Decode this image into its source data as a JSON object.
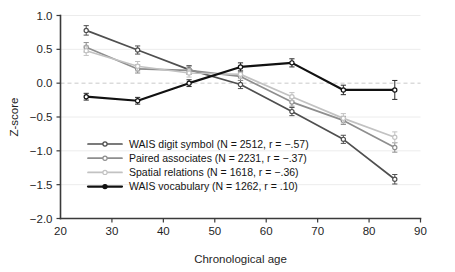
{
  "figure": {
    "partial_top_text": "",
    "background": "#ffffff"
  },
  "axes": {
    "y_title": "Z-score",
    "x_title": "Chronological age",
    "y_ticks": [
      "1.0",
      "0.5",
      "0.0",
      "-0.5",
      "-1.0",
      "-1.5",
      "-2.0"
    ],
    "x_ticks": [
      "20",
      "30",
      "40",
      "50",
      "60",
      "70",
      "80",
      "90"
    ]
  },
  "legend": {
    "items": [
      {
        "label": "WAIS digit symbol (N = 2512, r = -.57)",
        "color": "#4f4f4f",
        "marker": "open-circle"
      },
      {
        "label": "Paired associates (N = 2231, r = -.37)",
        "color": "#8e8e8e",
        "marker": "open-circle"
      },
      {
        "label": "Spatial relations (N = 1618, r = -.36)",
        "color": "#c2c2c2",
        "marker": "open-circle"
      },
      {
        "label": "WAIS vocabulary (N = 1262, r = .10)",
        "color": "#111111",
        "marker": "filled-circle"
      }
    ]
  },
  "chart_data": {
    "type": "line",
    "title": "",
    "xlabel": "Chronological age",
    "ylabel": "Z-score",
    "xlim": [
      20,
      90
    ],
    "ylim": [
      -2.0,
      1.0
    ],
    "ytick_step": 0.5,
    "xtick_step": 10,
    "grid": true,
    "zero_reference_line": true,
    "legend_position": "inside-lower-left",
    "error_bars": "standard error",
    "x": [
      25,
      35,
      45,
      55,
      65,
      75,
      85
    ],
    "series": [
      {
        "name": "WAIS digit symbol (N = 2512, r = -.57)",
        "short_name": "WAIS digit symbol",
        "n": 2512,
        "r": -0.57,
        "color": "#4f4f4f",
        "values": [
          0.78,
          0.49,
          0.2,
          -0.02,
          -0.42,
          -0.83,
          -1.42
        ],
        "errors": [
          0.07,
          0.06,
          0.06,
          0.06,
          0.06,
          0.06,
          0.07
        ]
      },
      {
        "name": "Paired associates (N = 2231, r = -.37)",
        "short_name": "Paired associates",
        "n": 2231,
        "r": -0.37,
        "color": "#8e8e8e",
        "values": [
          0.53,
          0.21,
          0.19,
          0.1,
          -0.28,
          -0.55,
          -0.95
        ],
        "errors": [
          0.07,
          0.06,
          0.06,
          0.06,
          0.06,
          0.06,
          0.07
        ]
      },
      {
        "name": "Spatial relations (N = 1618, r = -.36)",
        "short_name": "Spatial relations",
        "n": 1618,
        "r": -0.36,
        "color": "#c2c2c2",
        "values": [
          0.48,
          0.25,
          0.15,
          0.13,
          -0.2,
          -0.52,
          -0.8
        ],
        "errors": [
          0.07,
          0.07,
          0.06,
          0.06,
          0.06,
          0.07,
          0.08
        ]
      },
      {
        "name": "WAIS vocabulary (N = 1262, r = .10)",
        "short_name": "WAIS vocabulary",
        "n": 1262,
        "r": 0.1,
        "color": "#111111",
        "values": [
          -0.2,
          -0.26,
          0.0,
          0.24,
          0.3,
          -0.1,
          -0.1
        ],
        "errors": [
          0.05,
          0.05,
          0.05,
          0.06,
          0.06,
          0.07,
          0.14
        ]
      }
    ]
  }
}
